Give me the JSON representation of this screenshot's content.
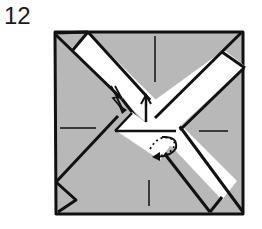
{
  "step": {
    "number": "12"
  },
  "diagram": {
    "colors": {
      "paper_shade": "#b8b8b8",
      "strip": "#ffffff",
      "line": "#111111"
    },
    "elements": [
      "shaded-square-base",
      "white-diagonal-strip-top-left-to-bottom-right",
      "white-diagonal-strip-top-right-to-center",
      "center-crease-marks",
      "zigzag-push-arrow",
      "up-arrow",
      "dotted-curved-fold-arrow",
      "bottom-left-corner-flap"
    ]
  }
}
